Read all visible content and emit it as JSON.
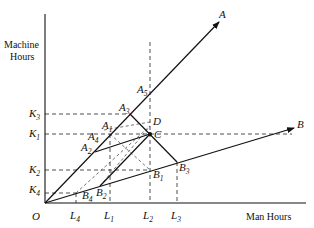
{
  "diagram": {
    "y_axis_label_line1": "Machine",
    "y_axis_label_line2": "Hours",
    "x_axis_label": "Man Hours",
    "origin_label": "O",
    "rays": [
      {
        "name": "A",
        "label": "A"
      },
      {
        "name": "B",
        "label": "B"
      }
    ],
    "y_ticks": [
      {
        "base": "K",
        "sub": "3"
      },
      {
        "base": "K",
        "sub": "1"
      },
      {
        "base": "K",
        "sub": "2"
      },
      {
        "base": "K",
        "sub": "4"
      }
    ],
    "x_ticks": [
      {
        "base": "L",
        "sub": "4"
      },
      {
        "base": "L",
        "sub": "1"
      },
      {
        "base": "L",
        "sub": "2"
      },
      {
        "base": "L",
        "sub": "3"
      }
    ],
    "points": {
      "A1": {
        "base": "A",
        "sub": "1"
      },
      "A2": {
        "base": "A",
        "sub": "2"
      },
      "A3": {
        "base": "A",
        "sub": "3"
      },
      "A4": {
        "base": "A",
        "sub": "4"
      },
      "A5": {
        "base": "A",
        "sub": "5"
      },
      "B1": {
        "base": "B",
        "sub": "1"
      },
      "B2": {
        "base": "B",
        "sub": "2"
      },
      "B3": {
        "base": "B",
        "sub": "3"
      },
      "B4": {
        "base": "B",
        "sub": "4"
      },
      "C": {
        "base": "C"
      },
      "D": {
        "base": "D"
      }
    }
  }
}
